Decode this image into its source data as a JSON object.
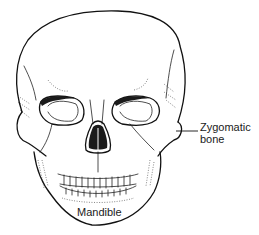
{
  "figure": {
    "labels": [
      {
        "id": "zygomatic",
        "lines": [
          "Zygomatic",
          "bone"
        ]
      },
      {
        "id": "mandible",
        "lines": [
          "Mandible"
        ]
      }
    ]
  }
}
